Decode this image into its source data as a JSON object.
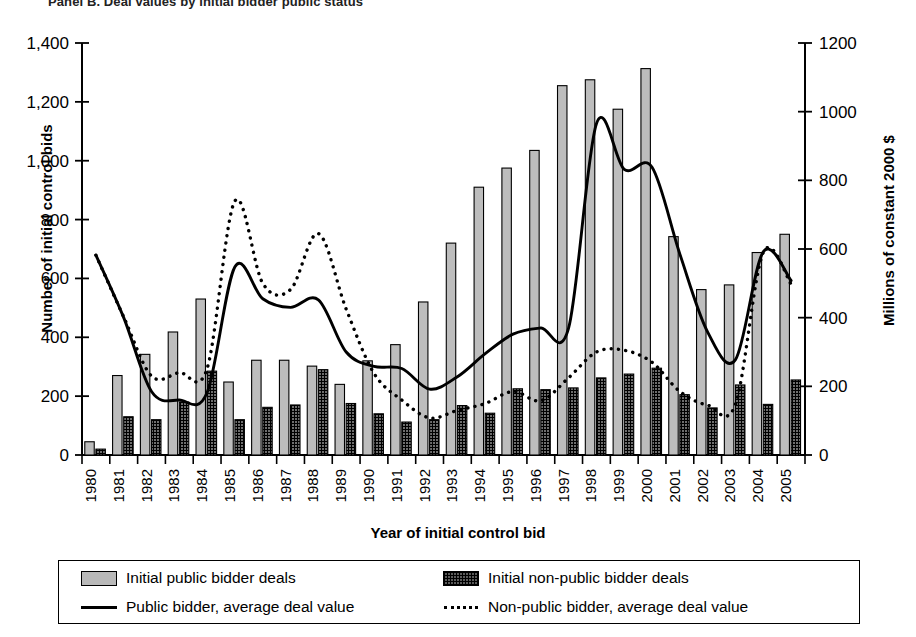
{
  "title": "Panel B. Deal values by initial bidder public status",
  "axes": {
    "y_left_label": "Number of initial control bids",
    "y_right_label": "Millions of constant 2000 $",
    "x_label": "Year of initial control bid",
    "y_left_ticks": [
      "0",
      "200",
      "400",
      "600",
      "800",
      "1,000",
      "1,200",
      "1,400"
    ],
    "y_right_ticks": [
      "0",
      "200",
      "400",
      "600",
      "800",
      "1000",
      "1200"
    ]
  },
  "legend": {
    "items": [
      {
        "label": "Initial public bidder deals",
        "swatch": "bar-light-gray",
        "type": "bar"
      },
      {
        "label": "Initial non-public bidder deals",
        "swatch": "bar-crosshatch",
        "type": "bar"
      },
      {
        "label": "Public bidder, average deal value",
        "swatch": "solid-line",
        "type": "line"
      },
      {
        "label": "Non-public bidder, average deal value",
        "swatch": "dotted-line",
        "type": "line"
      }
    ]
  },
  "chart_data": {
    "type": "bar",
    "title": "Panel B. Deal values by initial bidder public status",
    "xlabel": "Year of initial control bid",
    "ylabel": "Number of initial control bids",
    "ylabel_secondary": "Millions of constant 2000 $",
    "ylim": [
      0,
      1400
    ],
    "ylim_secondary": [
      0,
      1200
    ],
    "grid": false,
    "legend_position": "bottom",
    "categories": [
      "1980",
      "1981",
      "1982",
      "1983",
      "1984",
      "1985",
      "1986",
      "1987",
      "1988",
      "1989",
      "1990",
      "1991",
      "1992",
      "1993",
      "1994",
      "1995",
      "1996",
      "1997",
      "1998",
      "1999",
      "2000",
      "2001",
      "2002",
      "2003",
      "2004",
      "2005"
    ],
    "series": [
      {
        "name": "Initial public bidder deals",
        "type": "bar",
        "axis": "left",
        "values": [
          45,
          270,
          342,
          418,
          530,
          248,
          322,
          322,
          302,
          240,
          320,
          375,
          520,
          720,
          910,
          975,
          1035,
          1255,
          1275,
          1175,
          1313,
          742,
          562,
          578,
          688,
          750
        ]
      },
      {
        "name": "Initial non-public bidder deals",
        "type": "bar",
        "axis": "left",
        "values": [
          20,
          130,
          120,
          180,
          285,
          120,
          162,
          170,
          290,
          175,
          140,
          112,
          120,
          168,
          142,
          225,
          222,
          228,
          262,
          275,
          295,
          205,
          160,
          238,
          172,
          255
        ]
      },
      {
        "name": "Public bidder, average deal value",
        "type": "line",
        "style": "solid",
        "axis": "right",
        "values": [
          582,
          400,
          185,
          160,
          182,
          548,
          455,
          430,
          452,
          300,
          258,
          252,
          192,
          228,
          295,
          352,
          370,
          370,
          965,
          832,
          838,
          585,
          358,
          278,
          592,
          508
        ]
      },
      {
        "name": "Non-public bidder, average deal value",
        "type": "line",
        "style": "dotted",
        "axis": "right",
        "values": [
          582,
          402,
          230,
          240,
          252,
          740,
          500,
          482,
          645,
          425,
          238,
          160,
          108,
          130,
          150,
          185,
          158,
          225,
          300,
          305,
          270,
          185,
          145,
          148,
          590,
          498
        ]
      }
    ]
  }
}
